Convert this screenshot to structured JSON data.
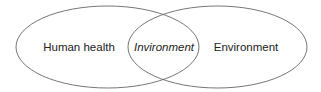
{
  "diagram": {
    "type": "venn",
    "stroke_color": "#666666",
    "text_color": "#222222",
    "sets": [
      {
        "id": "left",
        "label": "Human health",
        "cx": 107.5,
        "cy": 47,
        "rx": 91.5,
        "ry": 41
      },
      {
        "id": "right",
        "label": "Environment",
        "cx": 217.5,
        "cy": 47,
        "rx": 89.5,
        "ry": 41
      }
    ],
    "intersection": {
      "label": "Invironment",
      "italic": true
    }
  }
}
